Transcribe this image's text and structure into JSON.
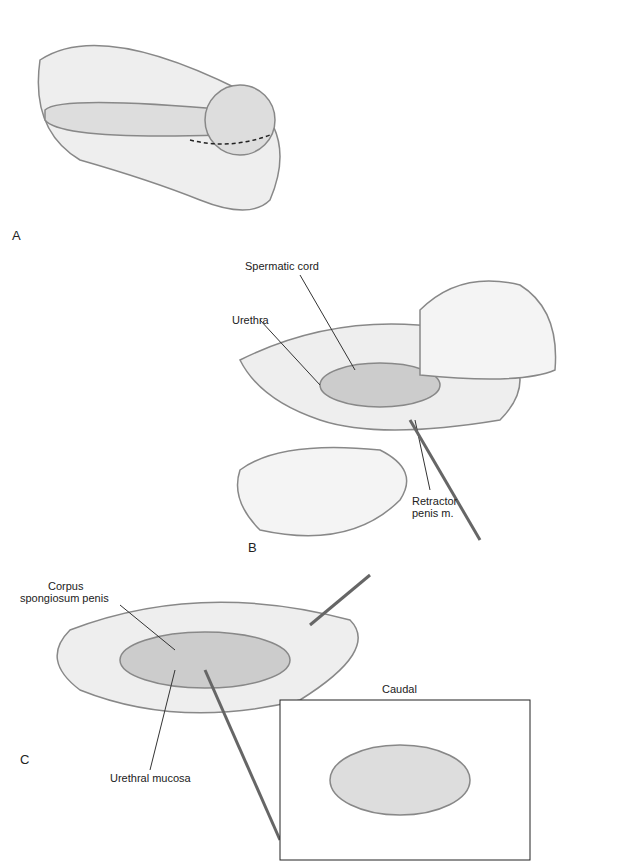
{
  "panels": [
    "A",
    "B",
    "C"
  ],
  "labels": {
    "spermatic_cord": "Spermatic cord",
    "urethra": "Urethra",
    "retractor_line1": "Retractor",
    "retractor_line2": "penis m.",
    "corpus_line1": "Corpus",
    "corpus_line2": "spongiosum penis",
    "urethral_mucosa": "Urethral mucosa",
    "caudal": "Caudal"
  }
}
